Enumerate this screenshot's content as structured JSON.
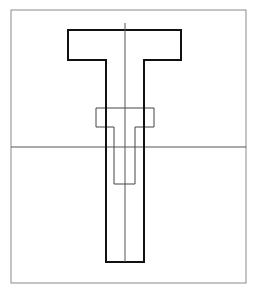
{
  "diagram": {
    "colors": {
      "background": "#ffffff",
      "frame": "#8a8a8a",
      "outer_t": "#111111",
      "inner_t": "#444444",
      "center_lines": "#555555"
    },
    "frame": {
      "x": 11,
      "y": 10,
      "width": 235,
      "height": 273
    },
    "outer_t": {
      "points": "68,30 181,30 181,60 144,60 144,262 106,262 106,60 68,60"
    },
    "inner_t": {
      "points": "96,108 154,108 154,127 135,127 135,184 114,184 114,127 96,127"
    },
    "vertical_center_line": {
      "x": 125,
      "y1": 23,
      "y2": 262
    },
    "horizontal_line": {
      "y": 147,
      "x1": 11,
      "x2": 246
    }
  }
}
